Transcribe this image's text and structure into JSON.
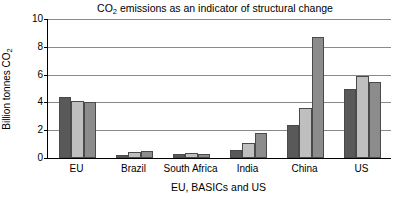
{
  "chart_data": {
    "type": "bar",
    "title": "CO2 emissions as an indicator of structural change",
    "title_main": "CO",
    "title_sub": "2",
    "title_rest": " emissions as an indicator of structural change",
    "xlabel": "EU, BASICs and US",
    "ylabel": "Billion tonnes CO2",
    "ylabel_main": "Billion tonnes CO",
    "ylabel_sub": "2",
    "categories": [
      "EU",
      "Brazil",
      "South Africa",
      "India",
      "China",
      "US"
    ],
    "series": [
      {
        "name": "Series 1",
        "color": "#595959",
        "values": [
          4.4,
          0.25,
          0.3,
          0.6,
          2.4,
          5.0
        ]
      },
      {
        "name": "Series 2",
        "color": "#bfbfbf",
        "values": [
          4.1,
          0.4,
          0.35,
          1.1,
          3.6,
          5.9
        ]
      },
      {
        "name": "Series 3",
        "color": "#8c8c8c",
        "values": [
          4.0,
          0.5,
          0.3,
          1.8,
          8.7,
          5.5
        ]
      }
    ],
    "ylim": [
      0,
      10
    ],
    "yticks": [
      0,
      2,
      4,
      6,
      8,
      10
    ],
    "ytick_labels": [
      "0",
      "2",
      "4",
      "6",
      "8",
      "10"
    ],
    "grid": true,
    "legend": "none",
    "gridline_color": "#8a8a8a",
    "axis_color": "#000000",
    "bar_edge_color": "#4a4a4a"
  }
}
